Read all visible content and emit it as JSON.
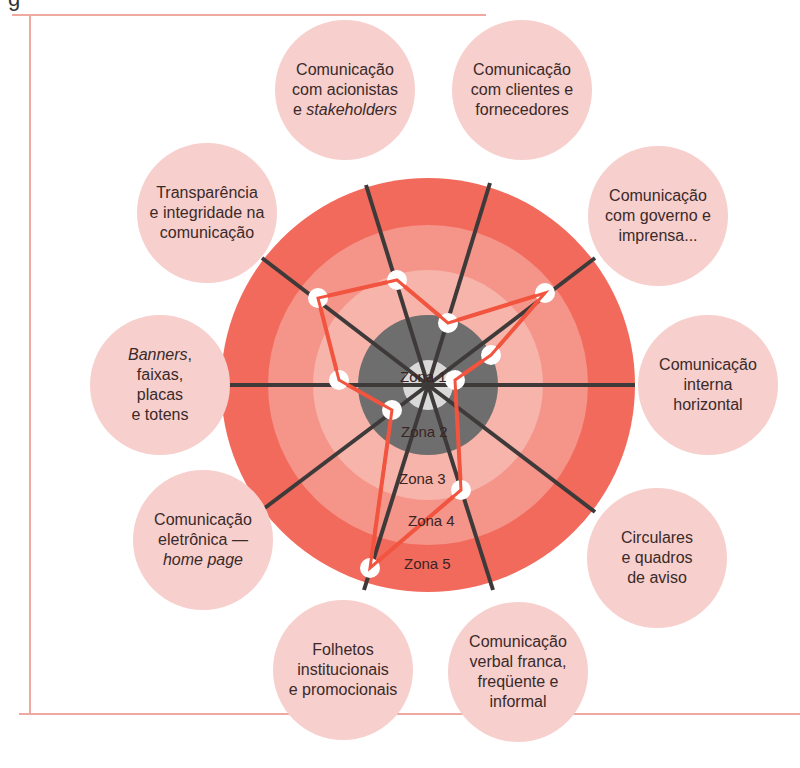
{
  "figure": {
    "corner_fragment": "g"
  },
  "zones": [
    {
      "label": "Zona 1",
      "radius": 25,
      "color": "#d9d9d9"
    },
    {
      "label": "Zona 2",
      "radius": 70,
      "color": "#6e6e6e"
    },
    {
      "label": "Zona 3",
      "radius": 115,
      "color": "#f7b4ab"
    },
    {
      "label": "Zona 4",
      "radius": 160,
      "color": "#f59489"
    },
    {
      "label": "Zona 5",
      "radius": 207,
      "color": "#f26a5c"
    }
  ],
  "categories": [
    {
      "id": "acionistas",
      "lines": [
        "Comunicação",
        "com acionistas",
        "e "
      ],
      "italic_tail": "stakeholders",
      "cx": 345,
      "cy": 90
    },
    {
      "id": "clientes",
      "lines": [
        "Comunicação",
        "com clientes e",
        "fornecedores"
      ],
      "cx": 522,
      "cy": 90
    },
    {
      "id": "governo",
      "lines": [
        "Comunicação",
        "com governo e",
        "imprensa..."
      ],
      "cx": 658,
      "cy": 216
    },
    {
      "id": "interna",
      "lines": [
        "Comunicação",
        "interna",
        "horizontal"
      ],
      "cx": 708,
      "cy": 385
    },
    {
      "id": "circulares",
      "lines": [
        "Circulares",
        "e quadros",
        "de aviso"
      ],
      "cx": 657,
      "cy": 558
    },
    {
      "id": "verbal",
      "lines": [
        "Comunicação",
        "verbal franca,",
        "freqüente e",
        "informal"
      ],
      "cx": 518,
      "cy": 672
    },
    {
      "id": "folhetos",
      "lines": [
        "Folhetos",
        "institucionais",
        "e promocionais"
      ],
      "cx": 343,
      "cy": 670
    },
    {
      "id": "homepage",
      "lines": [
        "Comunicação",
        "eletrônica —"
      ],
      "italic_tail": "home page",
      "cx": 203,
      "cy": 540
    },
    {
      "id": "banners",
      "italic_head": "Banners",
      "lines": [
        ",",
        "faixas,",
        "placas",
        "e totens"
      ],
      "cx": 160,
      "cy": 385
    },
    {
      "id": "transparencia",
      "lines": [
        "Transparência",
        "e integridade na",
        "comunicação"
      ],
      "cx": 207,
      "cy": 213
    }
  ],
  "spokes": [
    {
      "to": "acionistas",
      "x2": 366,
      "y2": 185
    },
    {
      "to": "clientes",
      "x2": 490,
      "y2": 183
    },
    {
      "to": "governo",
      "x2": 595,
      "y2": 258
    },
    {
      "to": "interna",
      "x2": 635,
      "y2": 385
    },
    {
      "to": "circulares",
      "x2": 595,
      "y2": 512
    },
    {
      "to": "verbal",
      "x2": 493,
      "y2": 590
    },
    {
      "to": "folhetos",
      "x2": 364,
      "y2": 590
    },
    {
      "to": "homepage",
      "x2": 262,
      "y2": 510
    },
    {
      "to": "banners",
      "x2": 221,
      "y2": 385
    },
    {
      "to": "transparencia",
      "x2": 262,
      "y2": 258
    }
  ],
  "profile_points": [
    {
      "category": "acionistas",
      "x": 397,
      "y": 280,
      "zone": 3
    },
    {
      "category": "clientes",
      "x": 448,
      "y": 323,
      "zone": 2
    },
    {
      "category": "governo",
      "x": 545,
      "y": 293,
      "zone": 4
    },
    {
      "category": "interna",
      "x": 491,
      "y": 355,
      "zone": 2
    },
    {
      "category": "circulares",
      "x": 455,
      "y": 380,
      "zone": 1
    },
    {
      "category": "verbal",
      "x": 461,
      "y": 490,
      "zone": 3
    },
    {
      "category": "folhetos",
      "x": 370,
      "y": 568,
      "zone": 5
    },
    {
      "category": "homepage",
      "x": 392,
      "y": 410,
      "zone": 2
    },
    {
      "category": "banners",
      "x": 339,
      "y": 380,
      "zone": 3
    },
    {
      "category": "transparencia",
      "x": 318,
      "y": 298,
      "zone": 4
    }
  ],
  "zone_labels": [
    {
      "text": "Zona 1",
      "x": 400,
      "y": 378
    },
    {
      "text": "Zona 2",
      "x": 401,
      "y": 433
    },
    {
      "text": "Zona 3",
      "x": 399,
      "y": 480
    },
    {
      "text": "Zona 4",
      "x": 408,
      "y": 522
    },
    {
      "text": "Zona 5",
      "x": 404,
      "y": 565
    }
  ],
  "colors": {
    "bubble": "#f7cfcc",
    "spoke": "#3f3a3a",
    "profile_line": "#f2553f",
    "marker": "#ffffff",
    "frame": "#f0a9a1"
  }
}
